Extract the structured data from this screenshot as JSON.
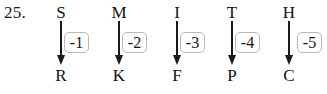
{
  "question": {
    "number_label": "25.",
    "type": "letter-shift-mapping"
  },
  "mappings": [
    {
      "source": "S",
      "shift": "-1",
      "target": "R",
      "x": 52
    },
    {
      "source": "M",
      "shift": "-2",
      "target": "K",
      "x": 110
    },
    {
      "source": "I",
      "shift": "-3",
      "target": "F",
      "x": 168
    },
    {
      "source": "T",
      "shift": "-4",
      "target": "P",
      "x": 223
    },
    {
      "source": "H",
      "shift": "-5",
      "target": "C",
      "x": 280
    }
  ],
  "style": {
    "ink_color": "#1a1a1a",
    "box_border_color": "#b8b8b8",
    "background_color": "#ffffff"
  }
}
